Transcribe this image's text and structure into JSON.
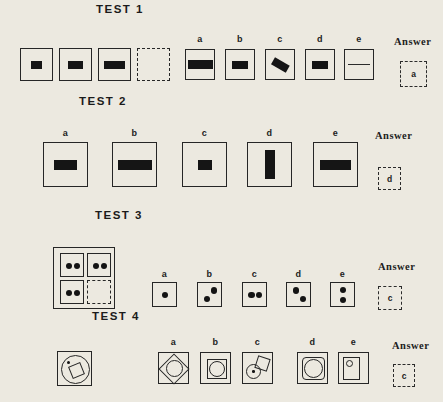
{
  "page": {
    "kind": "scanned-aptitude-test-sheet",
    "paper_color": "#ece9e0",
    "ink_color": "#1b1b1b"
  },
  "tests": [
    {
      "label": "TEST 1",
      "answer_label": "Answer",
      "answer": "a",
      "sequence_figures": [
        "square-with-small-bar",
        "square-with-medium-bar",
        "square-with-large-bar",
        "dashed-empty-square"
      ],
      "options": [
        {
          "letter": "a",
          "figure": "extra-wide-horizontal-bar"
        },
        {
          "letter": "b",
          "figure": "medium-horizontal-bar"
        },
        {
          "letter": "c",
          "figure": "tilted-bar"
        },
        {
          "letter": "d",
          "figure": "medium-horizontal-bar"
        },
        {
          "letter": "e",
          "figure": "thin-horizontal-line"
        }
      ]
    },
    {
      "label": "TEST 2",
      "answer_label": "Answer",
      "answer": "d",
      "options": [
        {
          "letter": "a",
          "figure": "medium-horizontal-bar"
        },
        {
          "letter": "b",
          "figure": "wide-horizontal-bar"
        },
        {
          "letter": "c",
          "figure": "small-horizontal-bar"
        },
        {
          "letter": "d",
          "figure": "vertical-bar"
        },
        {
          "letter": "e",
          "figure": "wide-horizontal-bar"
        }
      ]
    },
    {
      "label": "TEST 3",
      "answer_label": "Answer",
      "answer": "c",
      "stimulus": "2x2-grid-three-cells-with-two-dots-bottom-right-dashed-empty",
      "options": [
        {
          "letter": "a",
          "figure": "one-center-dot"
        },
        {
          "letter": "b",
          "figure": "two-dots-diagonal-rising"
        },
        {
          "letter": "c",
          "figure": "two-dots-horizontal"
        },
        {
          "letter": "d",
          "figure": "two-dots-diagonal-falling"
        },
        {
          "letter": "e",
          "figure": "two-dots-vertical"
        }
      ]
    },
    {
      "label": "TEST 4",
      "answer_label": "Answer",
      "answer": "c",
      "stimulus": "square-with-circle-containing-tilted-square-and-dot",
      "options": [
        {
          "letter": "a",
          "figure": "diamond-in-square-with-inscribed-circle"
        },
        {
          "letter": "b",
          "figure": "square-in-square-with-circle"
        },
        {
          "letter": "c",
          "figure": "dotted-circle-overlapping-tilted-square"
        },
        {
          "letter": "d",
          "figure": "rounded-inner-square-with-large-circle"
        },
        {
          "letter": "e",
          "figure": "inner-rectangle-with-small-circle-top-left"
        }
      ]
    }
  ]
}
